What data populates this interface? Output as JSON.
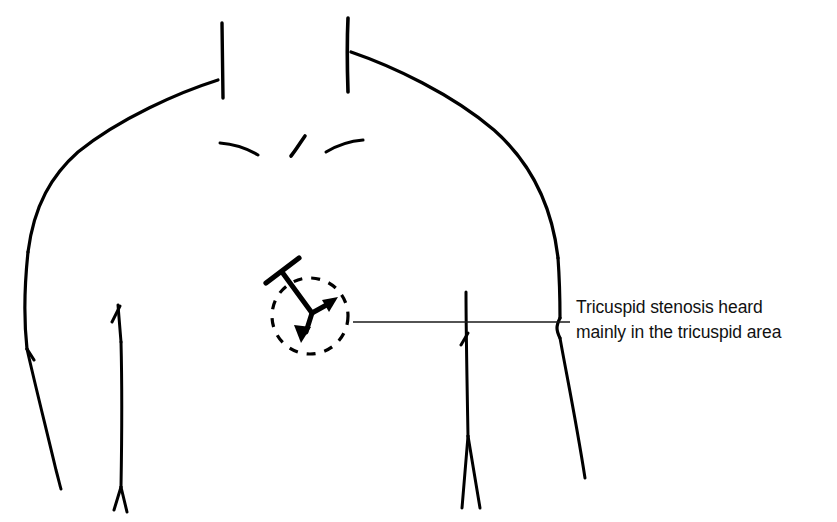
{
  "figure": {
    "type": "medical-illustration",
    "background_color": "#ffffff",
    "ink_color": "#000000",
    "width": 837,
    "height": 522
  },
  "annotation": {
    "line_1": "Tricuspid stenosis heard",
    "line_2": "mainly in the tricuspid area",
    "text_color": "#111111",
    "leader_line": {
      "from_x": 353,
      "to_x": 570,
      "y": 322,
      "color": "#1a1a1a"
    }
  },
  "auscultation_marker": {
    "name": "tricuspid-area",
    "circle": {
      "center_x": 310,
      "center_y": 316,
      "radius": 38,
      "style": "dashed",
      "color": "#000000"
    },
    "stethoscope": {
      "crossbar_from": [
        266,
        283
      ],
      "crossbar_to": [
        299,
        258
      ],
      "stem_from": [
        282,
        272
      ],
      "stem_to": [
        312,
        313
      ],
      "arrow_up_right_tip": [
        336,
        300
      ],
      "arrow_down_left_tip": [
        301,
        340
      ]
    }
  },
  "body_outline": {
    "neck_left_x": 222,
    "neck_right_x": 348,
    "neck_top_y": 20,
    "clavicle_strokes": 3,
    "arm_left_outer_x": 27,
    "arm_right_outer_x": 585,
    "shoulder_apex_left_y": 118,
    "shoulder_apex_right_y": 112
  }
}
